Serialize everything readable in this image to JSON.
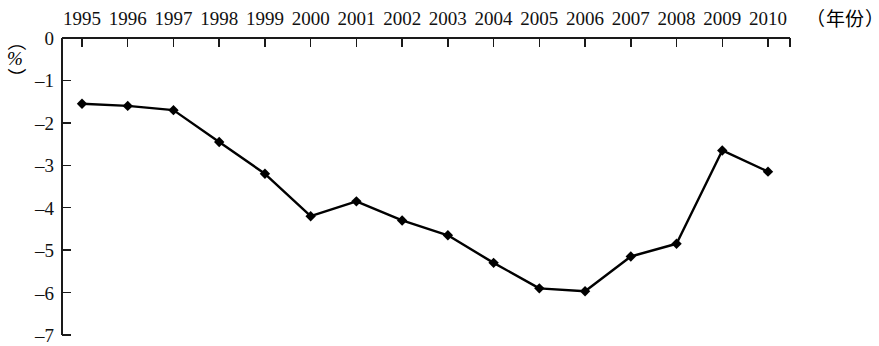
{
  "chart_data": {
    "type": "line",
    "title": "",
    "subtitle": "",
    "xlabel": "（年份）",
    "ylabel": "（%）",
    "categories": [
      "1995",
      "1996",
      "1997",
      "1998",
      "1999",
      "2000",
      "2001",
      "2002",
      "2003",
      "2004",
      "2005",
      "2006",
      "2007",
      "2008",
      "2009",
      "2010"
    ],
    "values": [
      -1.55,
      -1.6,
      -1.7,
      -2.45,
      -3.2,
      -4.2,
      -3.85,
      -4.3,
      -4.65,
      -5.3,
      -5.9,
      -5.97,
      -5.15,
      -4.85,
      -2.65,
      -3.15
    ],
    "series": [
      {
        "name": "",
        "values": [
          -1.55,
          -1.6,
          -1.7,
          -2.45,
          -3.2,
          -4.2,
          -3.85,
          -4.3,
          -4.65,
          -5.3,
          -5.9,
          -5.97,
          -5.15,
          -4.85,
          -2.65,
          -3.15
        ]
      }
    ],
    "xlim": [
      "1995",
      "2010"
    ],
    "ylim": [
      -7,
      0
    ],
    "y_ticks": [
      0,
      -1,
      -2,
      -3,
      -4,
      -5,
      -6,
      -7
    ],
    "y_tick_labels": [
      "0",
      "–1",
      "–2",
      "–3",
      "–4",
      "–5",
      "–6",
      "–7"
    ],
    "x_tick_labels": [
      "1995",
      "1996",
      "1997",
      "1998",
      "1999",
      "2000",
      "2001",
      "2002",
      "2003",
      "2004",
      "2005",
      "2006",
      "2007",
      "2008",
      "2009",
      "2010"
    ],
    "grid": false,
    "legend": "none",
    "marker": "diamond",
    "line_color": "#000000",
    "marker_color": "#000000",
    "axis_color": "#1a1a1a",
    "background_color": "#ffffff",
    "x_axis_position": "top",
    "annotations": []
  },
  "axes": {
    "x_axis_title": "（年份）",
    "y_axis_unit_open": "（",
    "y_axis_unit_symbol": "%",
    "y_axis_unit_close": "）"
  }
}
